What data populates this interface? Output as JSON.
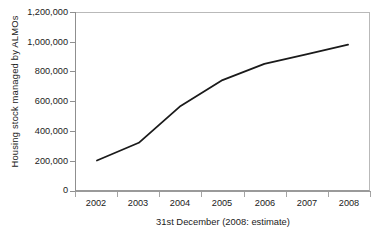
{
  "chart_data": {
    "type": "line",
    "title": "",
    "xlabel": "31st December (2008: estimate)",
    "ylabel": "Housing stock managed by ALMOs",
    "categories": [
      "2002",
      "2003",
      "2004",
      "2005",
      "2006",
      "2007",
      "2008"
    ],
    "values": [
      200000,
      320000,
      570000,
      745000,
      855000,
      920000,
      985000
    ],
    "series": [
      {
        "name": "Housing stock managed by ALMOs",
        "values": [
          200000,
          320000,
          570000,
          745000,
          855000,
          920000,
          985000
        ]
      }
    ],
    "ylim": [
      0,
      1200000
    ],
    "ytick_values": [
      0,
      200000,
      400000,
      600000,
      800000,
      1000000,
      1200000
    ],
    "ytick_labels": [
      "0",
      "200,000",
      "400,000",
      "600,000",
      "800,000",
      "1,000,000",
      "1,200,000"
    ],
    "xtick_labels": [
      "2002",
      "2003",
      "2004",
      "2005",
      "2006",
      "2007",
      "2008"
    ],
    "grid": false,
    "legend": null,
    "legend_position": "none",
    "line_color": "#1a1a1a",
    "axis_color": "#9a9a9a",
    "background_color": "#ffffff",
    "annotations": []
  },
  "figure": {
    "y_axis_title": "Housing stock managed by ALMOs",
    "x_axis_title": "31st December (2008: estimate)"
  }
}
